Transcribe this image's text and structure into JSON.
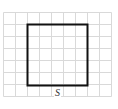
{
  "figure": {
    "grid": {
      "cols": 9,
      "rows": 7,
      "cell_size": 12,
      "line_color": "#d9d9d9"
    },
    "square": {
      "col_start": 2,
      "row_start": 1,
      "size_cells": 5,
      "stroke_color": "#111111",
      "stroke_width": 2
    },
    "label": {
      "text": "S"
    }
  }
}
